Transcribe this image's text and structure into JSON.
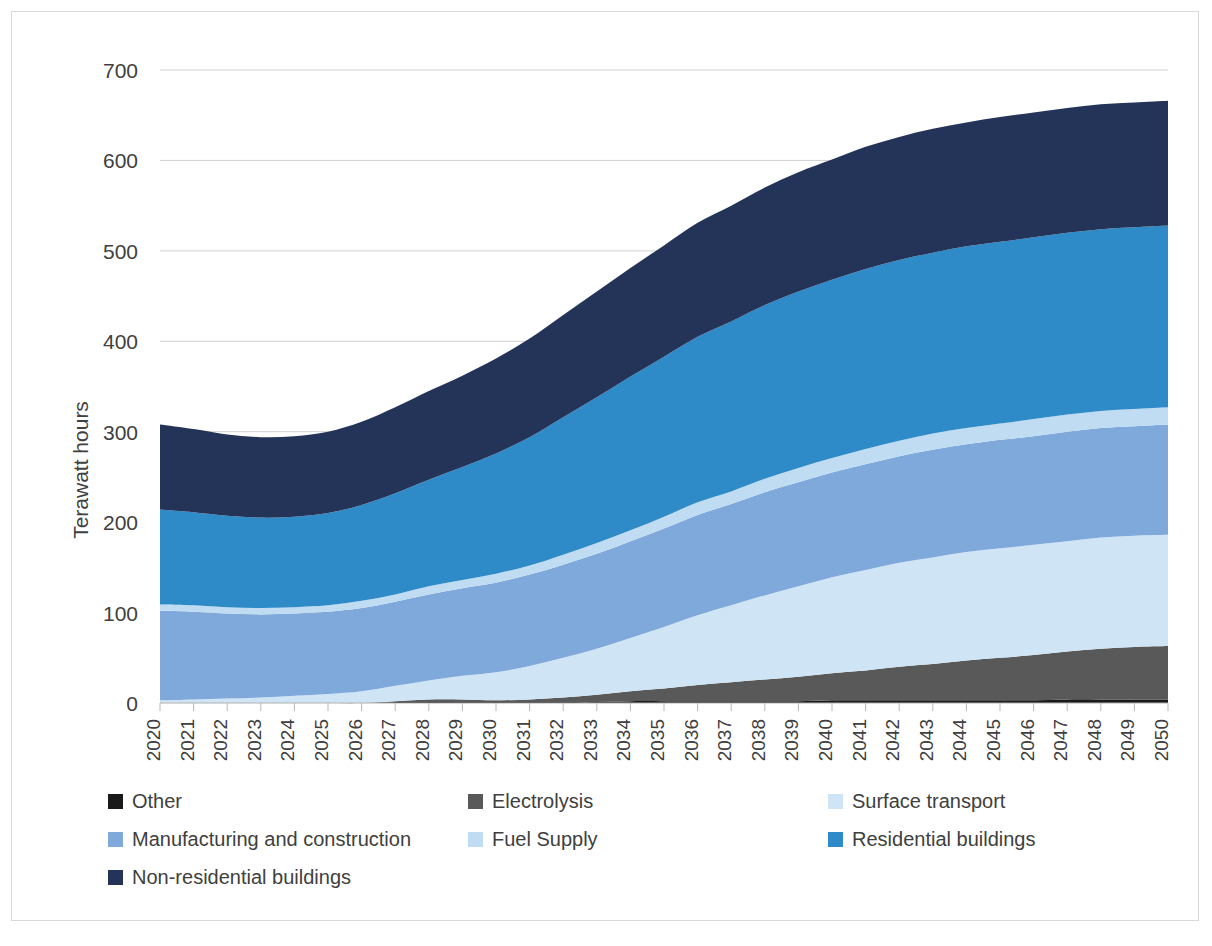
{
  "chart_data": {
    "type": "area",
    "stacked": true,
    "title": "",
    "subtitle": "",
    "xlabel": "",
    "ylabel": "Terawatt hours",
    "ylim": [
      0,
      700
    ],
    "y_ticks": [
      0,
      100,
      200,
      300,
      400,
      500,
      600,
      700
    ],
    "grid": "horizontal",
    "legend_position": "bottom",
    "x": [
      2020,
      2021,
      2022,
      2023,
      2024,
      2025,
      2026,
      2027,
      2028,
      2029,
      2030,
      2031,
      2032,
      2033,
      2034,
      2035,
      2036,
      2037,
      2038,
      2039,
      2040,
      2041,
      2042,
      2043,
      2044,
      2045,
      2046,
      2047,
      2048,
      2049,
      2050
    ],
    "categories": [
      "2020",
      "2021",
      "2022",
      "2023",
      "2024",
      "2025",
      "2026",
      "2027",
      "2028",
      "2029",
      "2030",
      "2031",
      "2032",
      "2033",
      "2034",
      "2035",
      "2036",
      "2037",
      "2038",
      "2039",
      "2040",
      "2041",
      "2042",
      "2043",
      "2044",
      "2045",
      "2046",
      "2047",
      "2048",
      "2049",
      "2050"
    ],
    "series": [
      {
        "name": "Other",
        "color": "#1a1a1a",
        "values": [
          0,
          0,
          0,
          0,
          0,
          0,
          0,
          1,
          1,
          1,
          1,
          1,
          1,
          1,
          2,
          2,
          2,
          2,
          2,
          2,
          3,
          3,
          3,
          3,
          3,
          3,
          3,
          4,
          4,
          4,
          4
        ]
      },
      {
        "name": "Electrolysis",
        "color": "#595959",
        "values": [
          0,
          0,
          0,
          0,
          0,
          0,
          0,
          1,
          3,
          3,
          2,
          3,
          5,
          8,
          11,
          14,
          18,
          21,
          24,
          27,
          30,
          33,
          37,
          40,
          44,
          47,
          50,
          53,
          56,
          58,
          59
        ]
      },
      {
        "name": "Surface transport",
        "color": "#cfe5f5",
        "values": [
          3,
          4,
          5,
          6,
          8,
          10,
          13,
          17,
          21,
          26,
          31,
          37,
          44,
          51,
          59,
          68,
          77,
          85,
          93,
          100,
          106,
          111,
          115,
          118,
          120,
          121,
          122,
          122,
          123,
          123,
          123
        ]
      },
      {
        "name": "Manufacturing and construction",
        "color": "#7fa9da",
        "values": [
          99,
          97,
          94,
          92,
          91,
          91,
          92,
          93,
          95,
          97,
          99,
          101,
          103,
          105,
          107,
          109,
          111,
          112,
          114,
          115,
          116,
          117,
          118,
          119,
          119,
          120,
          120,
          121,
          121,
          121,
          122
        ]
      },
      {
        "name": "Fuel Supply",
        "color": "#bfdcf2",
        "values": [
          7,
          7,
          7,
          7,
          7,
          7,
          8,
          8,
          9,
          9,
          10,
          10,
          11,
          12,
          12,
          13,
          14,
          14,
          15,
          16,
          16,
          17,
          17,
          18,
          18,
          18,
          19,
          19,
          19,
          19,
          19
        ]
      },
      {
        "name": "Residential buildings",
        "color": "#2e8bc8",
        "values": [
          105,
          103,
          101,
          100,
          100,
          102,
          106,
          112,
          118,
          125,
          133,
          142,
          152,
          161,
          170,
          177,
          183,
          188,
          192,
          195,
          197,
          199,
          200,
          200,
          201,
          201,
          201,
          201,
          201,
          201,
          201
        ]
      },
      {
        "name": "Non-residential buildings",
        "color": "#243459",
        "values": [
          94,
          92,
          90,
          89,
          89,
          90,
          92,
          95,
          98,
          101,
          105,
          109,
          113,
          117,
          120,
          123,
          126,
          128,
          130,
          132,
          133,
          135,
          136,
          137,
          137,
          138,
          138,
          138,
          138,
          138,
          138
        ]
      }
    ],
    "totals": [
      308,
      303,
      297,
      294,
      295,
      300,
      311,
      327,
      345,
      362,
      381,
      403,
      429,
      455,
      481,
      506,
      531,
      550,
      570,
      587,
      601,
      615,
      626,
      635,
      642,
      648,
      653,
      658,
      662,
      664,
      666
    ]
  },
  "axes": {
    "y_title": "Terawatt hours",
    "y_labels": [
      "700",
      "600",
      "500",
      "400",
      "300",
      "200",
      "100",
      "0"
    ],
    "x_labels": [
      "2020",
      "2021",
      "2022",
      "2023",
      "2024",
      "2025",
      "2026",
      "2027",
      "2028",
      "2029",
      "2030",
      "2031",
      "2032",
      "2033",
      "2034",
      "2035",
      "2036",
      "2037",
      "2038",
      "2039",
      "2040",
      "2041",
      "2042",
      "2043",
      "2044",
      "2045",
      "2046",
      "2047",
      "2048",
      "2049",
      "2050"
    ]
  },
  "legend": {
    "items": [
      {
        "label": "Other",
        "color": "#1a1a1a"
      },
      {
        "label": "Electrolysis",
        "color": "#595959"
      },
      {
        "label": "Surface transport",
        "color": "#cfe5f5"
      },
      {
        "label": "Manufacturing and construction",
        "color": "#7fa9da"
      },
      {
        "label": "Fuel Supply",
        "color": "#bfdcf2"
      },
      {
        "label": "Residential buildings",
        "color": "#2e8bc8"
      },
      {
        "label": "Non-residential buildings",
        "color": "#243459"
      }
    ]
  }
}
